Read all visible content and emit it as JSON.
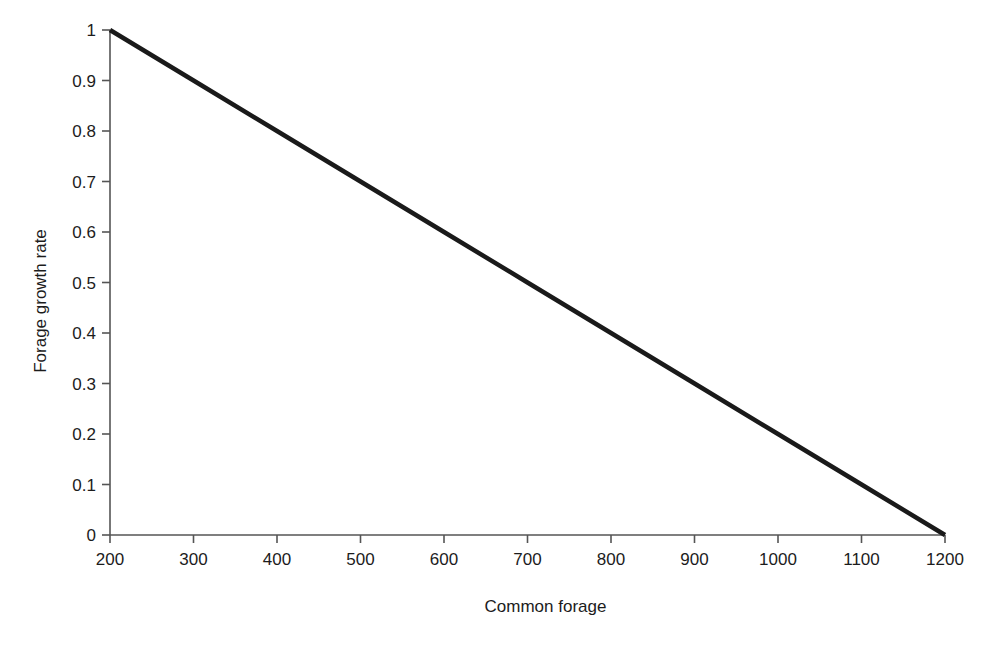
{
  "chart_data": {
    "type": "line",
    "title": "",
    "subtitle": "",
    "xlabel": "Common forage",
    "ylabel": "Forage growth rate",
    "xlim": [
      200,
      1200
    ],
    "ylim": [
      0,
      1
    ],
    "grid": false,
    "legend": null,
    "legend_position": "none",
    "x_ticks": [
      200,
      300,
      400,
      500,
      600,
      700,
      800,
      900,
      1000,
      1100,
      1200
    ],
    "x_tick_labels": [
      "200",
      "300",
      "400",
      "500",
      "600",
      "700",
      "800",
      "900",
      "1000",
      "1100",
      "1200"
    ],
    "y_ticks": [
      0,
      0.1,
      0.2,
      0.3,
      0.4,
      0.5,
      0.6,
      0.7,
      0.8,
      0.9,
      1
    ],
    "y_tick_labels": [
      "0",
      "0.1",
      "0.2",
      "0.3",
      "0.4",
      "0.5",
      "0.6",
      "0.7",
      "0.8",
      "0.9",
      "1"
    ],
    "series": [
      {
        "name": "forage growth rate",
        "color": "#1a1a1a",
        "line_width": 4.5,
        "x": [
          200,
          300,
          400,
          500,
          600,
          700,
          800,
          900,
          1000,
          1100,
          1200
        ],
        "values": [
          1.0,
          0.9,
          0.8,
          0.7,
          0.6,
          0.5,
          0.4,
          0.3,
          0.2,
          0.1,
          0.0
        ]
      }
    ],
    "annotations": []
  },
  "style": {
    "background": "#ffffff",
    "axis_color": "#555555",
    "tick_color": "#555555",
    "text_color": "#1c1c1c",
    "series_color": "#1a1a1a"
  }
}
